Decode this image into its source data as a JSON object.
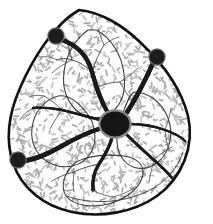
{
  "figure": {
    "background_color": "#ffffff",
    "width": 213,
    "height": 224
  },
  "colors": {
    "outline": "#111111",
    "vessel_major": "#1a1a1a",
    "vessel_minor": "#4a4a4a",
    "node_fill": "#1c1c1c",
    "node_ring": "#6d6d6d",
    "hub_fill": "#151515",
    "hub_ring": "#8c8c8c",
    "tissue_fleck": "#a9a9a9",
    "tissue_fleck_light": "#c3c3c3",
    "tissue_base": "#fdfdfd",
    "parenchyma_edge": "#3d3d3d"
  },
  "outline": {
    "label": "organ-capsule-contour",
    "shape": "teardrop",
    "apex": {
      "x": 79,
      "y": 10
    },
    "stroke_width": 2.6,
    "path": "M 79 10 C 101 12 124 26 142 44 C 163 64 181 88 188 116 C 195 146 182 178 157 196 C 133 213 100 218 72 212 C 44 206 22 189 13 163 C 5 139 9 113 20 88 C 32 60 54 24 79 10 Z"
  },
  "inner_rim": {
    "label": "capsule-inner-rim",
    "stroke_width": 0.9,
    "path": "M 66 196 C 92 205 124 203 148 191 C 166 182 178 168 183 152"
  },
  "hub": {
    "label": "hilum-vascular-hub",
    "cx": 115,
    "cy": 124,
    "rx": 14.5,
    "ry": 12.5,
    "ring_width": 2.2
  },
  "nodes": [
    {
      "id": "node-upper-left",
      "label": "attachment-node-upper-left",
      "cx": 56,
      "cy": 36,
      "r": 7.6
    },
    {
      "id": "node-upper-right",
      "label": "attachment-node-upper-right",
      "cx": 157,
      "cy": 57,
      "r": 7.6
    },
    {
      "id": "node-lower-left",
      "label": "attachment-node-lower-left",
      "cx": 18,
      "cy": 160,
      "r": 7.6
    }
  ],
  "major_vessels": [
    {
      "id": "vessel-to-upper-left-node",
      "label": "major-vessel-hub-to-upper-left-node",
      "width": 4.2,
      "path": "M 108 113 C 100 100 96 86 92 72 C 88 58 80 46 62 40"
    },
    {
      "id": "vessel-to-upper-right-node",
      "label": "major-vessel-hub-to-upper-right-node",
      "width": 4.4,
      "path": "M 125 115 C 133 104 140 90 146 78 C 150 70 153 63 154 60"
    },
    {
      "id": "vessel-to-lower-left-node",
      "label": "major-vessel-hub-to-lower-left-node",
      "width": 4.4,
      "path": "M 102 128 C 88 132 74 139 60 147 C 46 155 32 160 23 161"
    },
    {
      "id": "vessel-descending-mid",
      "label": "major-vessel-hub-descending-midline",
      "width": 3.2,
      "path": "M 112 137 C 110 148 104 156 99 164 C 94 172 92 180 93 190"
    },
    {
      "id": "vessel-descending-right",
      "label": "major-vessel-hub-descending-right",
      "width": 2.6,
      "path": "M 126 134 C 136 144 145 152 154 160 C 162 167 168 173 172 178"
    },
    {
      "id": "vessel-lateral-left",
      "label": "major-vessel-hub-lateral-left",
      "width": 2.4,
      "path": "M 101 120 C 88 117 75 113 62 110 C 50 108 40 107 33 108"
    },
    {
      "id": "vessel-lateral-right",
      "label": "major-vessel-hub-lateral-right",
      "width": 2.3,
      "path": "M 130 124 C 142 124 154 126 165 130 C 174 133 181 137 185 141"
    }
  ],
  "minor_vessels": [
    {
      "id": "branch-ul-1",
      "label": "minor-vessel-branch",
      "width": 1.0,
      "path": "M 92 72 C 86 66 79 62 72 60 C 66 58 61 58 57 60"
    },
    {
      "id": "branch-ul-2",
      "label": "minor-vessel-branch",
      "width": 0.9,
      "path": "M 72 60 C 70 52 68 45 66 38"
    },
    {
      "id": "branch-ul-3",
      "label": "minor-vessel-branch",
      "width": 0.8,
      "path": "M 66 38 C 62 34 58 31 54 29"
    },
    {
      "id": "branch-ul-4",
      "label": "minor-vessel-branch",
      "width": 0.8,
      "path": "M 72 60 C 64 64 57 68 52 73"
    },
    {
      "id": "branch-ul-5",
      "label": "minor-vessel-branch",
      "width": 0.8,
      "path": "M 57 60 C 51 57 46 56 41 57"
    },
    {
      "id": "branch-up-1",
      "label": "minor-vessel-branch",
      "width": 0.9,
      "path": "M 92 72 C 95 62 99 53 104 45"
    },
    {
      "id": "branch-up-2",
      "label": "minor-vessel-branch",
      "width": 0.8,
      "path": "M 104 45 C 109 41 114 38 119 37"
    },
    {
      "id": "branch-up-3",
      "label": "minor-vessel-branch",
      "width": 0.8,
      "path": "M 104 45 C 101 38 99 33 98 28"
    },
    {
      "id": "branch-mid-1",
      "label": "minor-vessel-branch",
      "width": 0.9,
      "path": "M 96 88 C 104 84 112 82 120 82"
    },
    {
      "id": "branch-mid-2",
      "label": "minor-vessel-branch",
      "width": 0.8,
      "path": "M 120 82 C 127 78 133 73 138 68"
    },
    {
      "id": "branch-mid-3",
      "label": "minor-vessel-branch",
      "width": 0.8,
      "path": "M 120 82 C 124 90 128 96 133 101"
    },
    {
      "id": "branch-left-1",
      "label": "minor-vessel-branch",
      "width": 0.9,
      "path": "M 62 110 C 56 104 50 99 44 96"
    },
    {
      "id": "branch-left-2",
      "label": "minor-vessel-branch",
      "width": 0.8,
      "path": "M 62 110 C 57 117 53 123 50 129"
    },
    {
      "id": "branch-left-3",
      "label": "minor-vessel-branch",
      "width": 0.8,
      "path": "M 44 96 C 38 95 33 95 29 97"
    },
    {
      "id": "branch-left-4",
      "label": "minor-vessel-branch",
      "width": 0.8,
      "path": "M 33 108 C 27 111 23 115 20 120"
    },
    {
      "id": "branch-bot-1",
      "label": "minor-vessel-branch",
      "width": 0.9,
      "path": "M 99 164 C 90 166 82 168 74 172"
    },
    {
      "id": "branch-bot-2",
      "label": "minor-vessel-branch",
      "width": 0.9,
      "path": "M 74 172 C 66 174 58 177 52 181"
    },
    {
      "id": "branch-bot-3",
      "label": "minor-vessel-branch",
      "width": 0.8,
      "path": "M 74 172 C 73 180 73 186 74 192"
    },
    {
      "id": "branch-bot-4",
      "label": "minor-vessel-branch",
      "width": 0.8,
      "path": "M 93 190 C 99 194 106 196 113 197"
    },
    {
      "id": "branch-bot-5",
      "label": "minor-vessel-branch",
      "width": 0.8,
      "path": "M 113 197 C 121 195 128 192 134 188"
    },
    {
      "id": "branch-br-1",
      "label": "minor-vessel-branch",
      "width": 0.9,
      "path": "M 154 160 C 160 154 166 150 172 147"
    },
    {
      "id": "branch-br-2",
      "label": "minor-vessel-branch",
      "width": 0.8,
      "path": "M 154 160 C 152 168 150 175 149 182"
    },
    {
      "id": "branch-br-3",
      "label": "minor-vessel-branch",
      "width": 0.8,
      "path": "M 172 178 C 178 172 182 166 184 160"
    },
    {
      "id": "branch-r-1",
      "label": "minor-vessel-branch",
      "width": 0.8,
      "path": "M 165 130 C 168 122 170 115 171 108"
    },
    {
      "id": "branch-r-2",
      "label": "minor-vessel-branch",
      "width": 0.8,
      "path": "M 165 130 C 166 138 167 145 169 151"
    }
  ],
  "parenchyma_lobes": [
    {
      "id": "lobe-upper",
      "label": "tissue-lobe-boundary",
      "path": "M 88 30 C 74 40 66 56 64 72 C 62 88 66 100 76 110 C 88 120 102 120 112 112 C 122 104 126 90 124 74 C 122 56 112 38 96 30 Z"
    },
    {
      "id": "lobe-left",
      "label": "tissue-lobe-boundary",
      "path": "M 58 96 C 44 100 34 112 32 128 C 30 144 38 158 52 164 C 66 170 82 166 90 154 C 98 142 96 124 86 112 C 78 102 68 94 58 96 Z"
    },
    {
      "id": "lobe-right",
      "label": "tissue-lobe-boundary",
      "path": "M 134 92 C 148 92 162 102 168 118 C 174 134 170 152 158 162 C 146 172 130 170 122 158 C 114 146 116 126 124 110 C 128 100 130 94 134 92 Z"
    },
    {
      "id": "lobe-lower",
      "label": "tissue-lobe-boundary",
      "path": "M 76 162 C 64 172 60 186 66 196 C 74 206 92 208 108 204 C 124 200 138 190 142 178 C 146 166 138 158 124 156 C 106 154 88 156 76 162 Z"
    }
  ],
  "tissue_texture": {
    "label": "parenchyma-stipple-texture",
    "description": "short gray dashes filling the organ interior",
    "seed": 20250607,
    "count": 1150,
    "dash_min_length": 2.0,
    "dash_max_length": 6.0,
    "dash_width": 1.7
  }
}
